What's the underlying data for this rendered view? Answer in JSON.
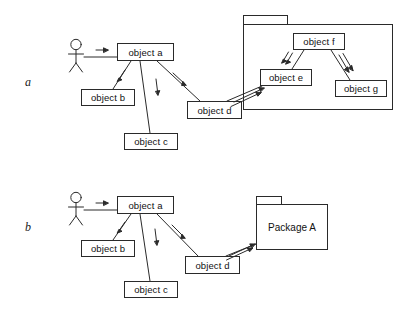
{
  "figure": {
    "type": "uml-collaboration-diagram",
    "background_color": "#ffffff",
    "line_color": "#2a2a2a",
    "text_color": "#111111",
    "width": 402,
    "height": 310
  },
  "panels": [
    {
      "key": "a",
      "label": "a",
      "actor": {
        "name": "actor",
        "label": ""
      },
      "objects": [
        {
          "id": "a",
          "label": "object a"
        },
        {
          "id": "b",
          "label": "object b"
        },
        {
          "id": "c",
          "label": "object c"
        },
        {
          "id": "d",
          "label": "object d"
        },
        {
          "id": "e",
          "label": "object e"
        },
        {
          "id": "f",
          "label": "object f"
        },
        {
          "id": "g",
          "label": "object g"
        }
      ],
      "package": {
        "label": "",
        "contains": [
          "object e",
          "object f",
          "object g"
        ]
      },
      "links": [
        {
          "from": "actor",
          "to": "object a",
          "arrow": "single"
        },
        {
          "from": "object a",
          "to": "object b",
          "arrow": "single"
        },
        {
          "from": "object a",
          "to": "object c",
          "arrow": "single"
        },
        {
          "from": "object a",
          "to": "object d",
          "arrow": "single"
        },
        {
          "from": "object d",
          "to": "object e",
          "arrow": "double"
        },
        {
          "from": "object f",
          "to": "object e",
          "arrow": "double"
        },
        {
          "from": "object f",
          "to": "object g",
          "arrow": "double"
        }
      ]
    },
    {
      "key": "b",
      "label": "b",
      "actor": {
        "name": "actor",
        "label": ""
      },
      "objects": [
        {
          "id": "a",
          "label": "object a"
        },
        {
          "id": "b",
          "label": "object b"
        },
        {
          "id": "c",
          "label": "object c"
        },
        {
          "id": "d",
          "label": "object d"
        }
      ],
      "package": {
        "label": "Package A",
        "contains": []
      },
      "links": [
        {
          "from": "actor",
          "to": "object a",
          "arrow": "single"
        },
        {
          "from": "object a",
          "to": "object b",
          "arrow": "single"
        },
        {
          "from": "object a",
          "to": "object c",
          "arrow": "single"
        },
        {
          "from": "object a",
          "to": "object d",
          "arrow": "single"
        },
        {
          "from": "object d",
          "to": "Package A",
          "arrow": "double"
        }
      ]
    }
  ]
}
